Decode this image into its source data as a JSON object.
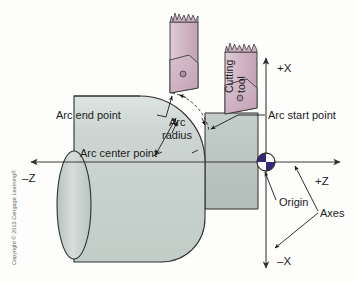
{
  "figure": {
    "background_color": "#fdfdfb"
  },
  "copyright": {
    "text": "Copyright © 2015 Cengage Learning®"
  },
  "axes": {
    "plus_x": "+X",
    "minus_x": "–X",
    "plus_z": "+Z",
    "minus_z": "–Z",
    "origin_label": "Origin",
    "axes_label": "Axes"
  },
  "callouts": {
    "arc_end_point": "Arc end point",
    "arc_radius_line1": "Arc",
    "arc_radius_line2": "radius",
    "arc_center_point": "Arc center point",
    "arc_start_point": "Arc start point"
  },
  "tools": {
    "cutting_tool_line1": "Cutting",
    "cutting_tool_line2": "tool"
  },
  "colors": {
    "workpiece_fill": "#c9d2ce",
    "workpiece_step_fill": "#b9c4c0",
    "workpiece_endface": "#ccd6d3",
    "tool_body": "#d3b9c6",
    "tool_insert": "#c8a9bb",
    "origin_dark": "#342a78",
    "origin_light": "#ffffff",
    "line_color": "#2e2e2e",
    "text_color": "#1b1b1b"
  }
}
